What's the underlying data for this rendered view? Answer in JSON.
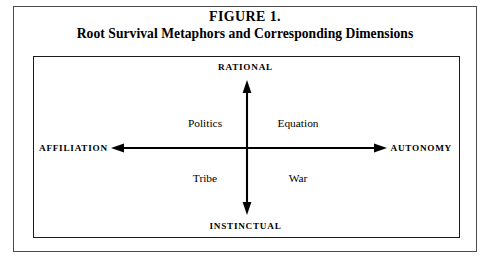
{
  "figure": {
    "number_label": "FIGURE 1.",
    "subtitle": "Root Survival Metaphors and Corresponding Dimensions"
  },
  "diagram": {
    "type": "two-by-two-quadrant",
    "axes": {
      "vertical": {
        "top_label": "RATIONAL",
        "bottom_label": "INSTINCTUAL",
        "arrowheads": "both"
      },
      "horizontal": {
        "left_label": "AFFILIATION",
        "right_label": "AUTONOMY",
        "arrowheads": "both"
      }
    },
    "quadrants": [
      {
        "position": "top-left",
        "label": "Politics"
      },
      {
        "position": "top-right",
        "label": "Equation"
      },
      {
        "position": "bottom-left",
        "label": "Tribe"
      },
      {
        "position": "bottom-right",
        "label": "War"
      }
    ]
  },
  "colors": {
    "ink": "#000000",
    "frame": "#4a4a4a",
    "box_border": "#1a1a1a",
    "background": "#ffffff"
  }
}
